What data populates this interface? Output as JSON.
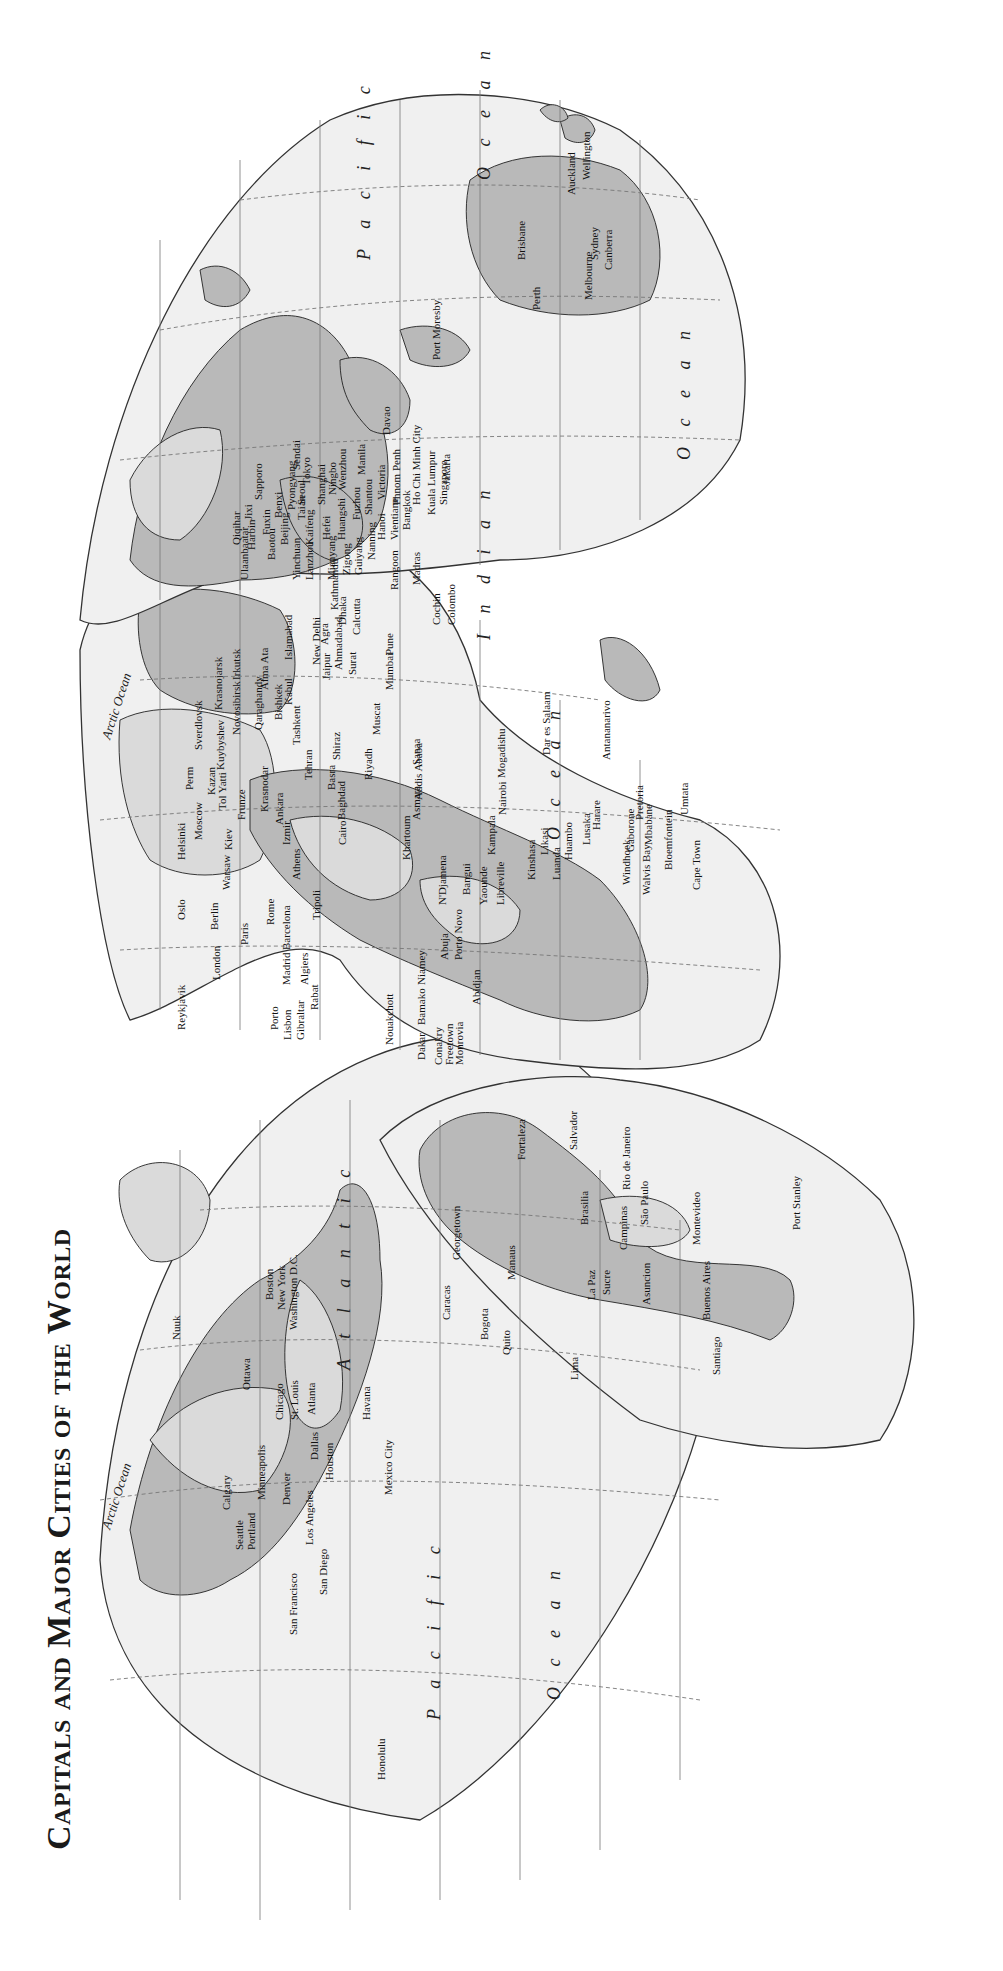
{
  "title": "Capitals and Major Cities of the World",
  "colors": {
    "ocean_fill": "#f0f0f0",
    "land_fill": "#b9b9b9",
    "land_light_fill": "#dadada",
    "outline": "#222222",
    "background": "#ffffff"
  },
  "orientation": "rotated 90° counter-clockwise (text reads bottom-to-top)",
  "projection": "interrupted (Goode-style) world map, three lobes",
  "oceans": [
    {
      "name": "Arctic Ocean",
      "lobe": "americas"
    },
    {
      "name": "Arctic Ocean",
      "lobe": "europe-asia"
    },
    {
      "name": "Atlantic",
      "lobe": "americas"
    },
    {
      "name": "Ocean",
      "lobe": "africa",
      "context": "Atlantic Ocean"
    },
    {
      "name": "Pacific",
      "lobe": "americas"
    },
    {
      "name": "Ocean",
      "lobe": "americas",
      "context": "Pacific Ocean"
    },
    {
      "name": "Indian",
      "lobe": "asia"
    },
    {
      "name": "Ocean",
      "lobe": "asia",
      "context": "Indian Ocean"
    },
    {
      "name": "Pacific",
      "lobe": "asia-east"
    },
    {
      "name": "Ocean",
      "lobe": "asia-east",
      "context": "Pacific Ocean"
    }
  ],
  "ocean_labels": {
    "arctic": "Arctic Ocean",
    "atlantic": "A t l a n t i c",
    "atlantic_ocean": "O c e a n",
    "pacific_west": "P a c i f i c",
    "pacific_west_ocean": "O c e a n",
    "indian": "I n d i a n",
    "indian_ocean": "O c e a n",
    "pacific_east": "P a c i f i c",
    "pacific_east_ocean": "O c e a n"
  },
  "cities": {
    "north_america": [
      "Nuuk",
      "Ottawa",
      "Boston",
      "New York",
      "Washington D.C.",
      "Chicago",
      "St. Louis",
      "Atlanta",
      "Minneapolis",
      "Calgary",
      "Seattle",
      "Portland",
      "Denver",
      "Dallas",
      "Houston",
      "Los Angeles",
      "San Francisco",
      "San Diego",
      "Havana",
      "Mexico City",
      "Honolulu"
    ],
    "south_america": [
      "Caracas",
      "Georgetown",
      "Bogota",
      "Quito",
      "Manaus",
      "Fortaleza",
      "Recife",
      "Salvador",
      "Brasilia",
      "Rio de Janeiro",
      "Campinas",
      "São Paulo",
      "Lima",
      "La Paz",
      "Sucre",
      "Asuncion",
      "Montevideo",
      "Buenos Aires",
      "Santiago",
      "Port Stanley"
    ],
    "europe": [
      "Reykjavik",
      "Oslo",
      "Helsinki",
      "London",
      "Berlin",
      "Paris",
      "Warsaw",
      "Moscow",
      "Kiev",
      "Rome",
      "Barcelona",
      "Madrid",
      "Porto",
      "Lisbon",
      "Gibraltar",
      "Athens",
      "Izmir",
      "Ankara",
      "Krasnodar",
      "Frunze",
      "Tol Yatti",
      "Kazan",
      "Perm",
      "Kuybyshev",
      "Sverdlovsk"
    ],
    "africa": [
      "Rabat",
      "Algiers",
      "Tripoli",
      "Cairo",
      "Khartoum",
      "Asmara",
      "Addis Ababa",
      "Nouakchott",
      "Dakar",
      "Bamako",
      "Conakry",
      "Freetown",
      "Monrovia",
      "Niamey",
      "Abuja",
      "Porto Novo",
      "Abidjan",
      "N'Djamena",
      "Bangui",
      "Yaounde",
      "Libreville",
      "Kinshasa",
      "Luanda",
      "Huambo",
      "Likasi",
      "Lusaka",
      "Kampala",
      "Nairobi",
      "Mogadishu",
      "Dar es Salaam",
      "Harare",
      "Windhoek",
      "Walvis Bay",
      "Gaborone",
      "Pretoria",
      "Mbabane",
      "Bloemfontein",
      "Cape Town",
      "Umtata",
      "Antananarivo"
    ],
    "middle_east_south_asia": [
      "Baghdad",
      "Basra",
      "Tehran",
      "Shiraz",
      "Riyadh",
      "Sanaa",
      "Muscat",
      "Tashkent",
      "Bishkek",
      "Alma Ata",
      "Qaraghandy",
      "Novosibirsk",
      "Krasnojarsk",
      "Irkutsk",
      "Kabul",
      "Islamabad",
      "New Delhi",
      "Jaipur",
      "Agra",
      "Ahmadabad",
      "Surat",
      "Calcutta",
      "Mumbai",
      "Pune",
      "Kathmandu",
      "Dhaka",
      "Madras",
      "Cochin",
      "Colombo",
      "Rangoon"
    ],
    "east_asia": [
      "Ulaanbaatar",
      "Qiqihar",
      "Harbin",
      "Jixi",
      "Fuxin",
      "Baotou",
      "Beijing",
      "Benxi",
      "Pyongyang",
      "Seoul",
      "Sapporo",
      "Sendai",
      "Tokyo",
      "Yinchuan",
      "Lanzhou",
      "Kaifeng",
      "Taian",
      "Hefei",
      "Shanghai",
      "Ningbo",
      "Wenzhou",
      "Huangshi",
      "Mianyang",
      "Zigong",
      "Guiyang",
      "Fuzhou",
      "Shantou",
      "Nanning",
      "Hanoi",
      "Victoria",
      "Vientiane",
      "Bangkok",
      "Phnom Penh",
      "Ho Chi Minh City",
      "Manila",
      "Davao",
      "Kuala Lumpur",
      "Singapore",
      "Jakarta"
    ],
    "oceania": [
      "Port Moresby",
      "Brisbane",
      "Sydney",
      "Canberra",
      "Melbourne",
      "Perth",
      "Auckland",
      "Wellington"
    ]
  }
}
